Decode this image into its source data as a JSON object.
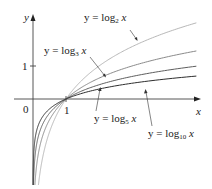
{
  "chart_data": {
    "type": "line",
    "title": "",
    "xlabel": "x",
    "ylabel": "y",
    "x_ticks": [
      "1"
    ],
    "y_ticks": [
      "1"
    ],
    "origin_label": "0",
    "xlim": [
      0,
      5
    ],
    "ylim": [
      -2.6,
      2.5
    ],
    "grid": false,
    "legend_position": "inline annotations with arrows",
    "series": [
      {
        "name": "y = log_2 x",
        "base": 2,
        "color": "#b8b8b8",
        "x": [
          0.05,
          0.25,
          0.5,
          1,
          2,
          3,
          4,
          5
        ],
        "values": [
          -4.32,
          -2.0,
          -1.0,
          0,
          1.0,
          1.585,
          2.0,
          2.322
        ]
      },
      {
        "name": "y = log_3 x",
        "base": 3,
        "color": "#8a8a8a",
        "x": [
          0.05,
          0.25,
          0.5,
          1,
          2,
          3,
          4,
          5
        ],
        "values": [
          -2.727,
          -1.262,
          -0.631,
          0,
          0.631,
          1.0,
          1.262,
          1.465
        ]
      },
      {
        "name": "y = log_5 x",
        "base": 5,
        "color": "#5e5e5e",
        "x": [
          0.05,
          0.25,
          0.5,
          1,
          2,
          3,
          4,
          5
        ],
        "values": [
          -1.861,
          -0.861,
          -0.431,
          0,
          0.431,
          0.683,
          0.861,
          1.0
        ]
      },
      {
        "name": "y = log_10 x",
        "base": 10,
        "color": "#2e2e2e",
        "x": [
          0.05,
          0.25,
          0.5,
          1,
          2,
          3,
          4,
          5
        ],
        "values": [
          -1.301,
          -0.602,
          -0.301,
          0,
          0.301,
          0.477,
          0.602,
          0.699
        ]
      }
    ],
    "annotations": [
      {
        "text": "y = log_2 x",
        "points_to": "log_2 curve"
      },
      {
        "text": "y = log_3 x",
        "points_to": "log_3 curve"
      },
      {
        "text": "y = log_5 x",
        "points_to": "log_5 curve"
      },
      {
        "text": "y = log_10 x",
        "points_to": "log_10 curve"
      }
    ]
  },
  "labels": {
    "y_axis": "y",
    "x_axis": "x",
    "origin": "0",
    "x_tick_1": "1",
    "y_tick_1": "1",
    "log2": {
      "prefix": "y = log",
      "sub": "2",
      "var": "x"
    },
    "log3": {
      "prefix": "y = log",
      "sub": "3",
      "var": "x"
    },
    "log5": {
      "prefix": "y = log",
      "sub": "5",
      "var": "x"
    },
    "log10": {
      "prefix": "y = log",
      "sub": "10",
      "var": "x"
    }
  }
}
